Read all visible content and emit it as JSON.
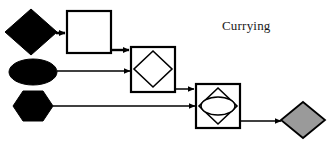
{
  "diagram": {
    "title": "Currying",
    "canvas": {
      "width": 331,
      "height": 150,
      "background": "#ffffff"
    },
    "colors": {
      "fill_black": "#000000",
      "fill_white": "#ffffff",
      "fill_gray": "#9a9a9a",
      "stroke": "#000000",
      "text": "#1a1a1a"
    },
    "nodes": [
      {
        "id": "input-diamond",
        "shape": "diamond",
        "fill": "#000000",
        "stroke": "#000000",
        "x": 31,
        "y": 32,
        "rx": 26,
        "ry": 23,
        "label": ""
      },
      {
        "id": "stage-one-box",
        "shape": "square",
        "fill": "#ffffff",
        "stroke": "#000000",
        "x": 67,
        "y": 11,
        "width": 44,
        "height": 42,
        "label": "",
        "contains": "empty"
      },
      {
        "id": "input-ellipse",
        "shape": "ellipse",
        "fill": "#000000",
        "stroke": "#000000",
        "x": 33,
        "y": 72,
        "rx": 24,
        "ry": 13,
        "label": ""
      },
      {
        "id": "stage-two-box",
        "shape": "square",
        "fill": "#ffffff",
        "stroke": "#000000",
        "x": 131,
        "y": 47,
        "width": 44,
        "height": 45,
        "label": "",
        "contains": "diamond"
      },
      {
        "id": "stage-two-inner-diamond",
        "shape": "diamond",
        "fill": "#ffffff",
        "stroke": "#000000",
        "x": 153,
        "y": 69,
        "rx": 19,
        "ry": 18,
        "label": ""
      },
      {
        "id": "input-hexagon",
        "shape": "hexagon",
        "fill": "#000000",
        "stroke": "#000000",
        "x": 33,
        "y": 106,
        "rx": 20,
        "ry": 16,
        "label": ""
      },
      {
        "id": "stage-three-box",
        "shape": "square",
        "fill": "#ffffff",
        "stroke": "#000000",
        "x": 196,
        "y": 84,
        "width": 44,
        "height": 44,
        "label": "",
        "contains": "diamond-with-ellipse"
      },
      {
        "id": "stage-three-inner-diamond",
        "shape": "diamond",
        "fill": "#ffffff",
        "stroke": "#000000",
        "x": 218,
        "y": 106,
        "rx": 19,
        "ry": 18,
        "label": ""
      },
      {
        "id": "stage-three-inner-ellipse",
        "shape": "ellipse",
        "fill": "#ffffff",
        "stroke": "#000000",
        "x": 218,
        "y": 106,
        "rx": 17,
        "ry": 9,
        "label": ""
      },
      {
        "id": "output-diamond",
        "shape": "diamond",
        "fill": "#9a9a9a",
        "stroke": "#000000",
        "x": 303,
        "y": 120,
        "rx": 22,
        "ry": 18,
        "label": ""
      }
    ],
    "edges": [
      {
        "id": "edge-diamond-to-box1",
        "from": "input-diamond",
        "to": "stage-one-box",
        "x1": 57,
        "y1": 33,
        "x2": 66,
        "y2": 33,
        "weight": "thick"
      },
      {
        "id": "edge-box1-to-box2",
        "from": "stage-one-box",
        "to": "stage-two-box",
        "x1": 111,
        "y1": 50,
        "x2": 130,
        "y2": 50,
        "weight": "thick"
      },
      {
        "id": "edge-ellipse-to-box2",
        "from": "input-ellipse",
        "to": "stage-two-box",
        "x1": 57,
        "y1": 71,
        "x2": 130,
        "y2": 71,
        "weight": "thin"
      },
      {
        "id": "edge-box2-to-box3",
        "from": "stage-two-box",
        "to": "stage-three-box",
        "x1": 175,
        "y1": 88,
        "x2": 195,
        "y2": 88,
        "weight": "thin"
      },
      {
        "id": "edge-hexagon-to-box3",
        "from": "input-hexagon",
        "to": "stage-three-box",
        "x1": 53,
        "y1": 106,
        "x2": 195,
        "y2": 106,
        "weight": "thin"
      },
      {
        "id": "edge-box3-to-output",
        "from": "stage-three-box",
        "to": "output-diamond",
        "x1": 240,
        "y1": 120,
        "x2": 280,
        "y2": 120,
        "weight": "thin"
      }
    ]
  }
}
